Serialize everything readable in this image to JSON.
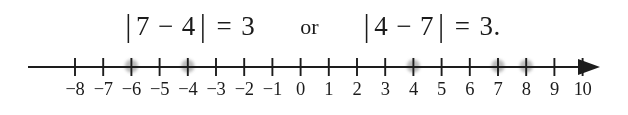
{
  "figure": {
    "background_color": "#ffffff",
    "ink_color": "#1b1b1b",
    "dot_color": "#a8a8a8"
  },
  "equation": {
    "left": {
      "open_bar": "|",
      "first_operand": "7",
      "operator": "−",
      "second_operand": "4",
      "close_bar": "|",
      "equals": "=",
      "result": "3"
    },
    "conjunction": "or",
    "right": {
      "open_bar": "|",
      "first_operand": "4",
      "operator": "−",
      "second_operand": "7",
      "close_bar": "|",
      "equals": "=",
      "result": "3."
    }
  },
  "number_line": {
    "min": -8,
    "max": 10,
    "tick_values": [
      -8,
      -7,
      -6,
      -5,
      -4,
      -3,
      -2,
      -1,
      0,
      1,
      2,
      3,
      4,
      5,
      6,
      7,
      8,
      9,
      10
    ],
    "tick_labels": [
      "−8",
      "−7",
      "−6",
      "−5",
      "−4",
      "−3",
      "−2",
      "−1",
      "0",
      "1",
      "2",
      "3",
      "4",
      "5",
      "6",
      "7",
      "8",
      "9",
      "10"
    ],
    "marked_points": [
      -6,
      -4,
      4,
      7,
      8
    ],
    "arrow_direction": "right",
    "left_end_style": "plain",
    "spacing_px": 28.2,
    "origin_px": 300.6,
    "axis_y_px": 19,
    "line_start_px": 28,
    "line_end_px": 596,
    "label_y_px": 47
  },
  "chart_data": {
    "type": "scatter",
    "title": "",
    "xlabel": "",
    "ylabel": "",
    "xlim": [
      -8,
      10
    ],
    "grid": false,
    "legend": null,
    "x_ticks": [
      -8,
      -7,
      -6,
      -5,
      -4,
      -3,
      -2,
      -1,
      0,
      1,
      2,
      3,
      4,
      5,
      6,
      7,
      8,
      9,
      10
    ],
    "x_tick_labels": [
      "−8",
      "−7",
      "−6",
      "−5",
      "−4",
      "−3",
      "−2",
      "−1",
      "0",
      "1",
      "2",
      "3",
      "4",
      "5",
      "6",
      "7",
      "8",
      "9",
      "10"
    ],
    "series": [
      {
        "name": "marked points",
        "values": [
          -6,
          -4,
          4,
          7,
          8
        ]
      }
    ],
    "annotations": [
      "|7 − 4| = 3",
      "or",
      "|4 − 7| = 3."
    ]
  }
}
